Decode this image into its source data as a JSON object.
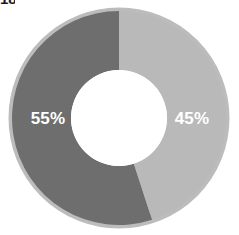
{
  "corner": {
    "fragment_text": "18"
  },
  "chart_data": {
    "type": "pie",
    "variant": "donut",
    "title": "",
    "subtitle": "",
    "xlabel": "",
    "ylabel": "",
    "legend": "none",
    "grid": false,
    "start_angle_deg": 0,
    "direction": "clockwise",
    "center": {
      "x": 119,
      "y": 118
    },
    "outer_radius": 107,
    "inner_radius": 48,
    "background": "#ffffff",
    "categories": [
      "45%",
      "55%"
    ],
    "values": [
      45,
      55
    ],
    "slices": [
      {
        "label": "45%",
        "value": 45,
        "color": "#b9b9b9",
        "ring_color": "#c4c4c4",
        "label_color": "#ffffff",
        "label_x": 192,
        "label_y": 120,
        "start_deg": 0,
        "end_deg": 162
      },
      {
        "label": "55%",
        "value": 55,
        "color": "#6e6e6e",
        "ring_color": "#bcbcbc",
        "label_color": "#ffffff",
        "label_x": 48,
        "label_y": 120,
        "start_deg": 162,
        "end_deg": 360
      }
    ]
  }
}
